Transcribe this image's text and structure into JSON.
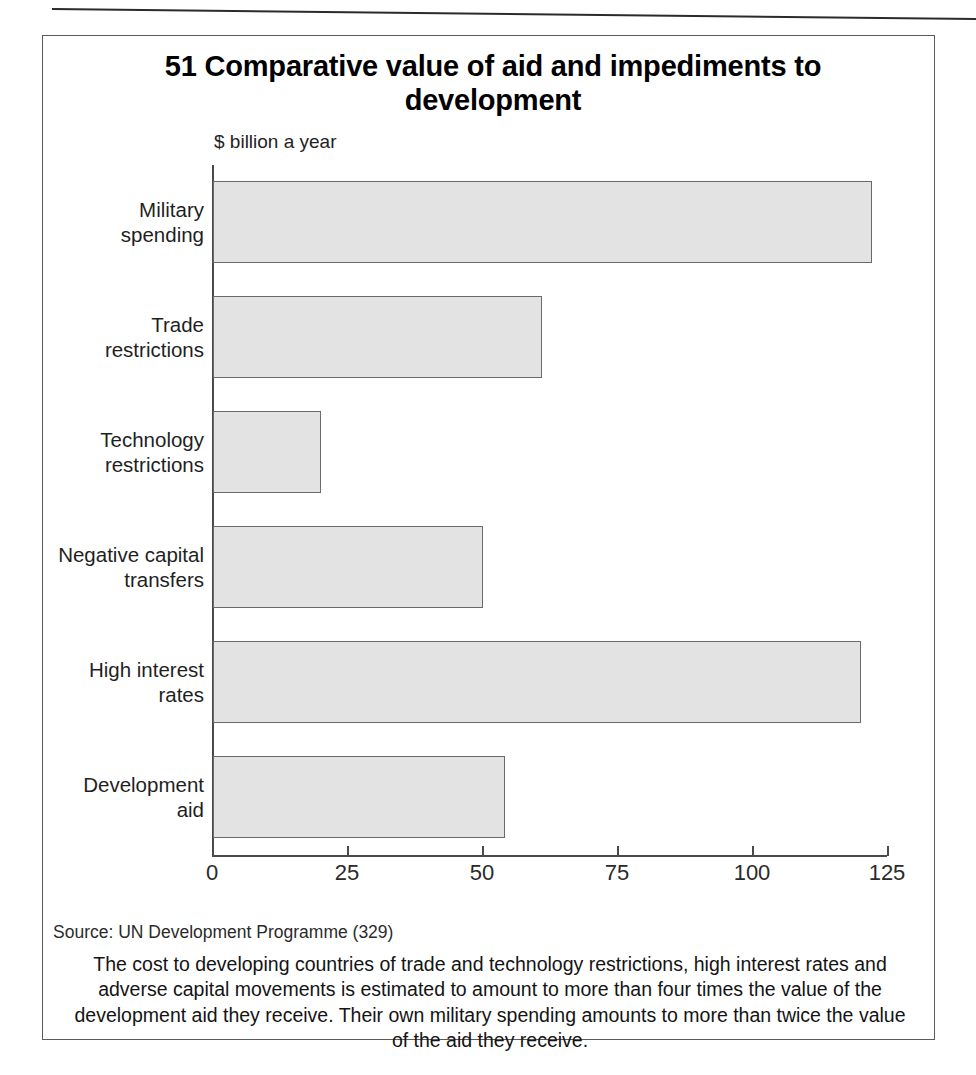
{
  "figure": {
    "number": "51",
    "title": "51 Comparative value of aid and impediments to development",
    "source": "Source: UN Development Programme (329)",
    "caption": "The cost to developing countries of trade and technology restrictions, high interest rates and adverse capital movements is estimated to amount to more than four times the value of the development aid they receive. Their own military spending amounts to more than twice the value of the aid they receive."
  },
  "chart_data": {
    "type": "bar",
    "orientation": "horizontal",
    "title": "51 Comparative value of aid and impediments to development",
    "xlabel": "$ billion a year",
    "ylabel": "",
    "categories": [
      "Military spending",
      "Trade restrictions",
      "Technology restrictions",
      "Negative capital transfers",
      "High interest rates",
      "Development aid"
    ],
    "values": [
      122,
      61,
      20,
      50,
      120,
      54
    ],
    "xlim": [
      0,
      125
    ],
    "xticks": [
      "0",
      "25",
      "50",
      "75",
      "100",
      "125"
    ],
    "xtick_values": [
      0,
      25,
      50,
      75,
      100,
      125
    ],
    "grid": false,
    "legend": false,
    "bar_fill": "#e3e3e3",
    "bar_stroke": "#6a6a6a",
    "axis_color": "#4a4a4a"
  },
  "category_lines": [
    [
      "Military",
      "spending"
    ],
    [
      "Trade",
      "restrictions"
    ],
    [
      "Technology",
      "restrictions"
    ],
    [
      "Negative capital",
      "transfers"
    ],
    [
      "High interest",
      "rates"
    ],
    [
      "Development",
      "aid"
    ]
  ]
}
